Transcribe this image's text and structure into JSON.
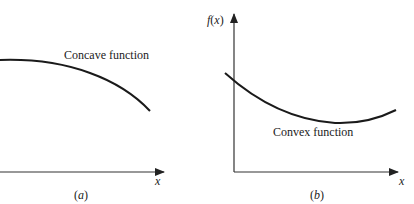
{
  "panels": [
    {
      "id": "a",
      "caption": "(a)",
      "caption_letter": "a",
      "curve_label": "Concave function",
      "x_axis_label": "x",
      "curve_type": "concave"
    },
    {
      "id": "b",
      "caption": "(b)",
      "caption_letter": "b",
      "curve_label": "Convex function",
      "x_axis_label": "x",
      "y_axis_label": "f(x)",
      "curve_type": "convex"
    }
  ],
  "colors": {
    "axis": "#333333",
    "curve": "#1a1a1a",
    "text": "#222222"
  }
}
